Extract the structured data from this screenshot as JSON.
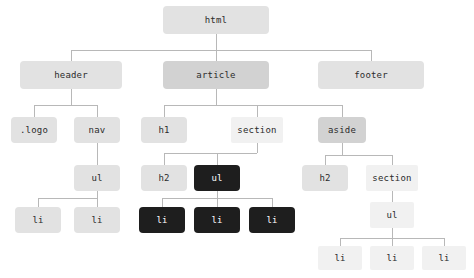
{
  "diagram": {
    "type": "tree",
    "colors": {
      "edge": "#b8b8b8",
      "background": "#ffffff",
      "light": "#e2e2e2",
      "mid": "#d2d2d2",
      "pale": "#f1f1f1",
      "dark": "#1e1e1e",
      "text_dark": "#2b2b2b",
      "text_light": "#ffffff"
    },
    "nodes": [
      {
        "id": "html",
        "label": "html",
        "tone": "light",
        "x": 163,
        "y": 6,
        "w": 106,
        "h": 28
      },
      {
        "id": "header",
        "label": "header",
        "tone": "light",
        "x": 20,
        "y": 61,
        "w": 102,
        "h": 28
      },
      {
        "id": "article",
        "label": "article",
        "tone": "mid",
        "x": 163,
        "y": 61,
        "w": 106,
        "h": 28
      },
      {
        "id": "footer",
        "label": "footer",
        "tone": "light",
        "x": 318,
        "y": 61,
        "w": 106,
        "h": 28
      },
      {
        "id": "logo",
        "label": ".logo",
        "tone": "light",
        "x": 11,
        "y": 117,
        "w": 46,
        "h": 26
      },
      {
        "id": "nav",
        "label": "nav",
        "tone": "light",
        "x": 74,
        "y": 117,
        "w": 46,
        "h": 26
      },
      {
        "id": "h1",
        "label": "h1",
        "tone": "light",
        "x": 141,
        "y": 117,
        "w": 46,
        "h": 26
      },
      {
        "id": "section-a",
        "label": "section",
        "tone": "pale",
        "x": 231,
        "y": 117,
        "w": 52,
        "h": 26
      },
      {
        "id": "aside",
        "label": "aside",
        "tone": "mid",
        "x": 318,
        "y": 117,
        "w": 48,
        "h": 26
      },
      {
        "id": "ul-nav",
        "label": "ul",
        "tone": "light",
        "x": 74,
        "y": 165,
        "w": 46,
        "h": 26
      },
      {
        "id": "h2-article",
        "label": "h2",
        "tone": "light",
        "x": 141,
        "y": 165,
        "w": 46,
        "h": 26
      },
      {
        "id": "ul-section",
        "label": "ul",
        "tone": "dark",
        "x": 194,
        "y": 165,
        "w": 46,
        "h": 26
      },
      {
        "id": "h2-aside",
        "label": "h2",
        "tone": "light",
        "x": 302,
        "y": 165,
        "w": 46,
        "h": 26
      },
      {
        "id": "section-b",
        "label": "section",
        "tone": "pale",
        "x": 366,
        "y": 165,
        "w": 52,
        "h": 26
      },
      {
        "id": "li-nav-1",
        "label": "li",
        "tone": "light",
        "x": 15,
        "y": 207,
        "w": 46,
        "h": 26
      },
      {
        "id": "li-nav-2",
        "label": "li",
        "tone": "light",
        "x": 74,
        "y": 207,
        "w": 46,
        "h": 26
      },
      {
        "id": "li-art-1",
        "label": "li",
        "tone": "dark",
        "x": 139,
        "y": 207,
        "w": 46,
        "h": 26
      },
      {
        "id": "li-art-2",
        "label": "li",
        "tone": "dark",
        "x": 194,
        "y": 207,
        "w": 46,
        "h": 26
      },
      {
        "id": "li-art-3",
        "label": "li",
        "tone": "dark",
        "x": 249,
        "y": 207,
        "w": 46,
        "h": 26
      },
      {
        "id": "ul-aside",
        "label": "ul",
        "tone": "pale",
        "x": 370,
        "y": 202,
        "w": 44,
        "h": 26
      },
      {
        "id": "li-as-1",
        "label": "li",
        "tone": "pale",
        "x": 318,
        "y": 246,
        "w": 44,
        "h": 24
      },
      {
        "id": "li-as-2",
        "label": "li",
        "tone": "pale",
        "x": 370,
        "y": 246,
        "w": 44,
        "h": 24
      },
      {
        "id": "li-as-3",
        "label": "li",
        "tone": "pale",
        "x": 422,
        "y": 246,
        "w": 44,
        "h": 24
      }
    ],
    "edges": [
      {
        "parent": "html",
        "children": [
          "header",
          "article",
          "footer"
        ],
        "bus_y": 50
      },
      {
        "parent": "header",
        "children": [
          "logo",
          "nav"
        ],
        "bus_y": 105
      },
      {
        "parent": "article",
        "children": [
          "h1",
          "section-a",
          "aside"
        ],
        "bus_y": 105
      },
      {
        "parent": "nav",
        "children": [
          "ul-nav"
        ],
        "bus_y": 155
      },
      {
        "parent": "section-a",
        "children": [
          "h2-article",
          "ul-section"
        ],
        "bus_y": 153
      },
      {
        "parent": "aside",
        "children": [
          "h2-aside",
          "section-b"
        ],
        "bus_y": 155
      },
      {
        "parent": "ul-nav",
        "children": [
          "li-nav-1",
          "li-nav-2"
        ],
        "bus_y": 198
      },
      {
        "parent": "ul-section",
        "children": [
          "li-art-1",
          "li-art-2",
          "li-art-3"
        ],
        "bus_y": 198
      },
      {
        "parent": "section-b",
        "children": [
          "ul-aside"
        ],
        "bus_y": 196
      },
      {
        "parent": "ul-aside",
        "children": [
          "li-as-1",
          "li-as-2",
          "li-as-3"
        ],
        "bus_y": 238
      }
    ]
  }
}
